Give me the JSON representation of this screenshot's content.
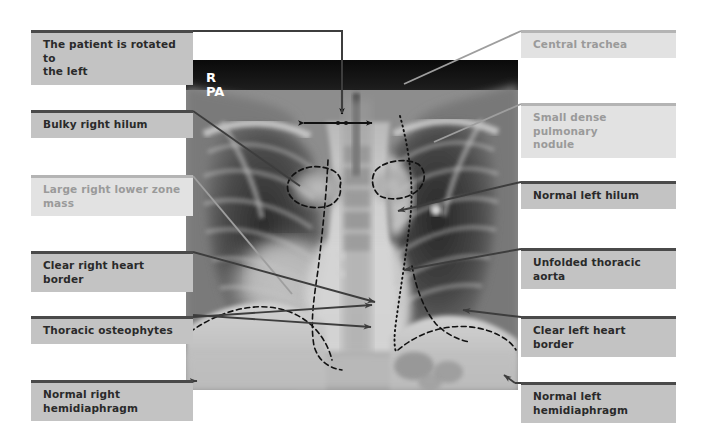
{
  "figure": {
    "width": 701,
    "height": 443,
    "background": "#ffffff"
  },
  "xray": {
    "view_marker_line1": "R",
    "view_marker_line2": "PA",
    "bounds": {
      "x": 186,
      "y": 60,
      "width": 332,
      "height": 330
    },
    "overlays": [
      {
        "name": "right-hilum-dashed-outline",
        "style": "dashed"
      },
      {
        "name": "left-hilum-dashed-outline",
        "style": "dashed"
      },
      {
        "name": "trachea-width-caliper",
        "style": "double-headed-arrow"
      },
      {
        "name": "trachea-pointer-arrow",
        "style": "arrow"
      },
      {
        "name": "right-heart-border-dashed",
        "style": "dashed"
      },
      {
        "name": "left-heart-border-dashed",
        "style": "dashed"
      },
      {
        "name": "thoracic-aorta-dotted",
        "style": "dotted"
      },
      {
        "name": "right-hemidiaphragm-dashed",
        "style": "dashed"
      },
      {
        "name": "left-hemidiaphragm-dashed",
        "style": "dashed"
      }
    ]
  },
  "colors": {
    "rule_dark": "#4a4a4a",
    "rule_light": "#b4b4b4",
    "box_dark": "#c3c3c3",
    "box_light": "#e2e2e2",
    "text_dark": "#2a2a2a",
    "text_light": "#9a9a9a",
    "leader_dark": "#4a4a4a",
    "leader_light": "#a5a5a5"
  },
  "labels_left": [
    {
      "id": "patient-rotated",
      "text": "The patient is rotated to\nthe left",
      "emphasis": "dark"
    },
    {
      "id": "bulky-right-hilum",
      "text": "Bulky right hilum",
      "emphasis": "dark"
    },
    {
      "id": "large-right-lower-zone-mass",
      "text": "Large right lower zone\nmass",
      "emphasis": "light"
    },
    {
      "id": "clear-right-heart-border",
      "text": "Clear right heart border",
      "emphasis": "dark"
    },
    {
      "id": "thoracic-osteophytes",
      "text": "Thoracic osteophytes",
      "emphasis": "dark"
    },
    {
      "id": "normal-right-hemidiaphragm",
      "text": "Normal right\nhemidiaphragm",
      "emphasis": "dark"
    }
  ],
  "labels_right": [
    {
      "id": "central-trachea",
      "text": "Central trachea",
      "emphasis": "light"
    },
    {
      "id": "small-dense-pulmonary-nodule",
      "text": "Small dense pulmonary\nnodule",
      "emphasis": "light"
    },
    {
      "id": "normal-left-hilum",
      "text": "Normal left hilum",
      "emphasis": "dark"
    },
    {
      "id": "unfolded-thoracic-aorta",
      "text": "Unfolded thoracic aorta",
      "emphasis": "dark"
    },
    {
      "id": "clear-left-heart-border",
      "text": "Clear left heart border",
      "emphasis": "dark"
    },
    {
      "id": "normal-left-hemidiaphragm",
      "text": "Normal left\nhemidiaphragm",
      "emphasis": "dark"
    }
  ]
}
